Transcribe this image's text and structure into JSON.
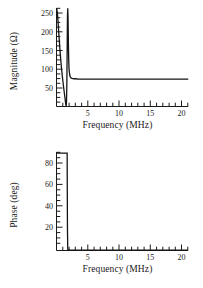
{
  "figure": {
    "background": "#ffffff",
    "line_color": "#141414",
    "axis_color": "#1a1a1a",
    "width": 203,
    "height": 288
  },
  "chart_data": [
    {
      "id": "magnitude-plot",
      "type": "line",
      "title": "",
      "xlabel": "Frequency (MHz)",
      "ylabel": "Magnitude (Ω)",
      "ylabel_unit": "Ω",
      "xlim": [
        0,
        21
      ],
      "ylim": [
        0,
        270
      ],
      "xticks": [
        5,
        10,
        15,
        20
      ],
      "xticklabels": [
        "5",
        "10",
        "15",
        "20"
      ],
      "xminor_step": 1,
      "yticks": [
        50,
        100,
        150,
        200,
        250
      ],
      "yticklabels": [
        "50",
        "100",
        "150",
        "200",
        "250"
      ],
      "yminor_step": 12.5,
      "grid": false,
      "legend": "none",
      "clipped_peak": true,
      "series": [
        {
          "name": "Magnitude",
          "x": [
            0.05,
            0.15,
            0.25,
            0.35,
            0.45,
            0.55,
            0.65,
            0.75,
            0.85,
            0.95,
            1.05,
            1.15,
            1.25,
            1.35,
            1.45,
            1.5,
            1.55,
            1.6,
            1.65,
            1.7,
            1.75,
            1.8,
            1.85,
            1.9,
            1.95,
            2.0,
            2.1,
            2.2,
            2.35,
            2.5,
            2.75,
            3.0,
            3.5,
            4.0,
            5.0,
            6.0,
            8.0,
            10.0,
            12.0,
            14.0,
            16.0,
            18.0,
            20.0,
            21.0
          ],
          "y": [
            268,
            255,
            232,
            205,
            180,
            156,
            134,
            114,
            96,
            80,
            65,
            51,
            37,
            24,
            10,
            4,
            2,
            14,
            60,
            150,
            248,
            268,
            240,
            170,
            128,
            104,
            87,
            81,
            78,
            77,
            76,
            76,
            75,
            75,
            75,
            75,
            75,
            75,
            75,
            75,
            75,
            75,
            75,
            75
          ]
        }
      ],
      "asymptote_value": 75,
      "resonance_min_hz": 1.55,
      "resonance_peak_hz": 1.82
    },
    {
      "id": "phase-plot",
      "type": "line",
      "title": "",
      "xlabel": "Frequency (MHz)",
      "ylabel": "Phase (deg)",
      "xlim": [
        0,
        21
      ],
      "ylim": [
        0,
        92
      ],
      "xticks": [
        5,
        10,
        15,
        20
      ],
      "xticklabels": [
        "5",
        "10",
        "15",
        "20"
      ],
      "xminor_step": 1,
      "yticks": [
        20,
        40,
        60,
        80
      ],
      "yticklabels": [
        "20",
        "40",
        "60",
        "80"
      ],
      "yminor_step": 5,
      "grid": false,
      "legend": "none",
      "series": [
        {
          "name": "Phase",
          "x": [
            0.05,
            0.5,
            1.0,
            1.4,
            1.6,
            1.7,
            1.72,
            1.75,
            1.8,
            2.0,
            3.0,
            5.0,
            8.0,
            12.0,
            16.0,
            20.0,
            21.0
          ],
          "y": [
            91,
            91,
            91,
            91,
            91,
            91,
            60,
            20,
            1,
            0.5,
            0.4,
            0.3,
            0.3,
            0.3,
            0.3,
            0.3,
            0.3
          ]
        }
      ],
      "step_down_hz": 1.72
    }
  ]
}
